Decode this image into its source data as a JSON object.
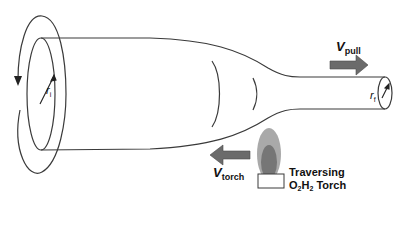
{
  "diagram": {
    "labels": {
      "v_pull": {
        "symbol": "V",
        "subscript": "pull"
      },
      "v_torch": {
        "symbol": "V",
        "subscript": "torch"
      },
      "r_initial": {
        "symbol": "r",
        "subscript": "i"
      },
      "r_final": {
        "symbol": "r",
        "subscript": "f"
      },
      "torch_line1": "Traversing",
      "torch_line2_parts": {
        "a": "O",
        "a_sub": "2",
        "b": "H",
        "b_sub": "2",
        "c": " Torch"
      }
    },
    "colors": {
      "line": "#3a3a3a",
      "arrow_fill": "#6b6b6b",
      "flame_outer": "#a9a9a9",
      "flame_inner": "#767676",
      "background": "#ffffff"
    },
    "elements": [
      "rotation-arrow",
      "large-tube-section",
      "tapered-waist-transition",
      "thin-fiber-section",
      "pull-direction-arrow",
      "torch-direction-arrow",
      "torch-flame",
      "torch-base"
    ]
  }
}
